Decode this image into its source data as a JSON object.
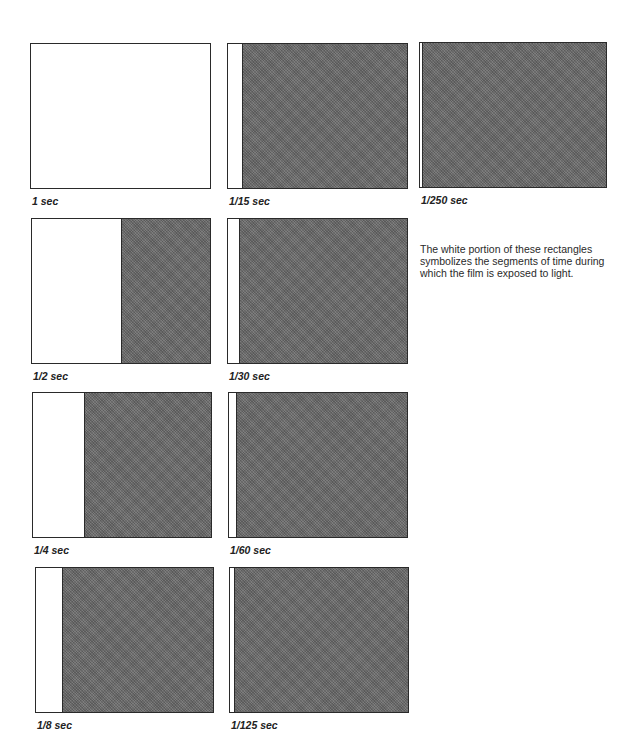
{
  "chart_data": {
    "type": "diagram",
    "title": "",
    "panels": [
      {
        "label": "1 sec",
        "exposed_fraction": 1.0
      },
      {
        "label": "1/2 sec",
        "exposed_fraction": 0.5
      },
      {
        "label": "1/4 sec",
        "exposed_fraction": 0.29
      },
      {
        "label": "1/8 sec",
        "exposed_fraction": 0.15
      },
      {
        "label": "1/15 sec",
        "exposed_fraction": 0.08
      },
      {
        "label": "1/30 sec",
        "exposed_fraction": 0.06
      },
      {
        "label": "1/60 sec",
        "exposed_fraction": 0.04
      },
      {
        "label": "1/125 sec",
        "exposed_fraction": 0.025
      },
      {
        "label": "1/250 sec",
        "exposed_fraction": 0.012
      }
    ],
    "colors": {
      "exposed": "#ffffff",
      "unexposed": "#6e6e6e",
      "border": "#2a2a2a"
    }
  },
  "note": "The white portion of these rectangles symbolizes the segments of time during which the film is exposed to light."
}
